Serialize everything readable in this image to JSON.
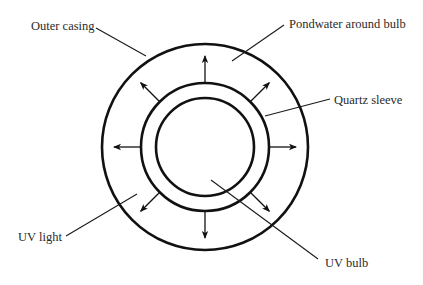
{
  "diagram": {
    "colors": {
      "stroke": "#111111",
      "text": "#2a2a2a",
      "background": "#ffffff"
    },
    "geometry": {
      "center": [
        205,
        147
      ],
      "outer_radius": 103,
      "sleeve_radius": 64,
      "bulb_radius": 49
    },
    "labels": {
      "outer_casing": "Outer casing",
      "pondwater": "Pondwater around bulb",
      "quartz_sleeve": "Quartz sleeve",
      "uv_light": "UV light",
      "uv_bulb": "UV bulb"
    },
    "uv_rays": {
      "count": 8,
      "directions_deg": [
        0,
        45,
        90,
        135,
        180,
        225,
        270,
        315
      ],
      "length": 26
    }
  }
}
